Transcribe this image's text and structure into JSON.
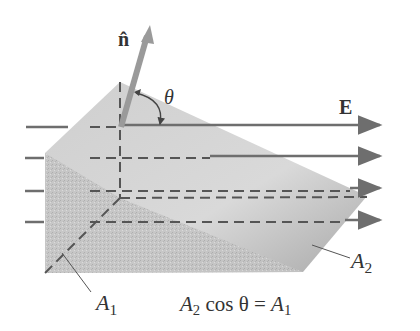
{
  "diagram": {
    "labels": {
      "normal": "n̂",
      "angle": "θ",
      "field": "E",
      "area1": "A",
      "area1_sub": "1",
      "area2": "A",
      "area2_sub": "2"
    },
    "equation": {
      "lhs_var": "A",
      "lhs_sub": "2",
      "op": " cos θ = ",
      "rhs_var": "A",
      "rhs_sub": "1"
    },
    "colors": {
      "field_line": "#6e6e6e",
      "dash": "#555555",
      "face_light": "#d6d6d6",
      "face_dark": "#bdbdbd",
      "vector": "#9a9a9a"
    }
  }
}
